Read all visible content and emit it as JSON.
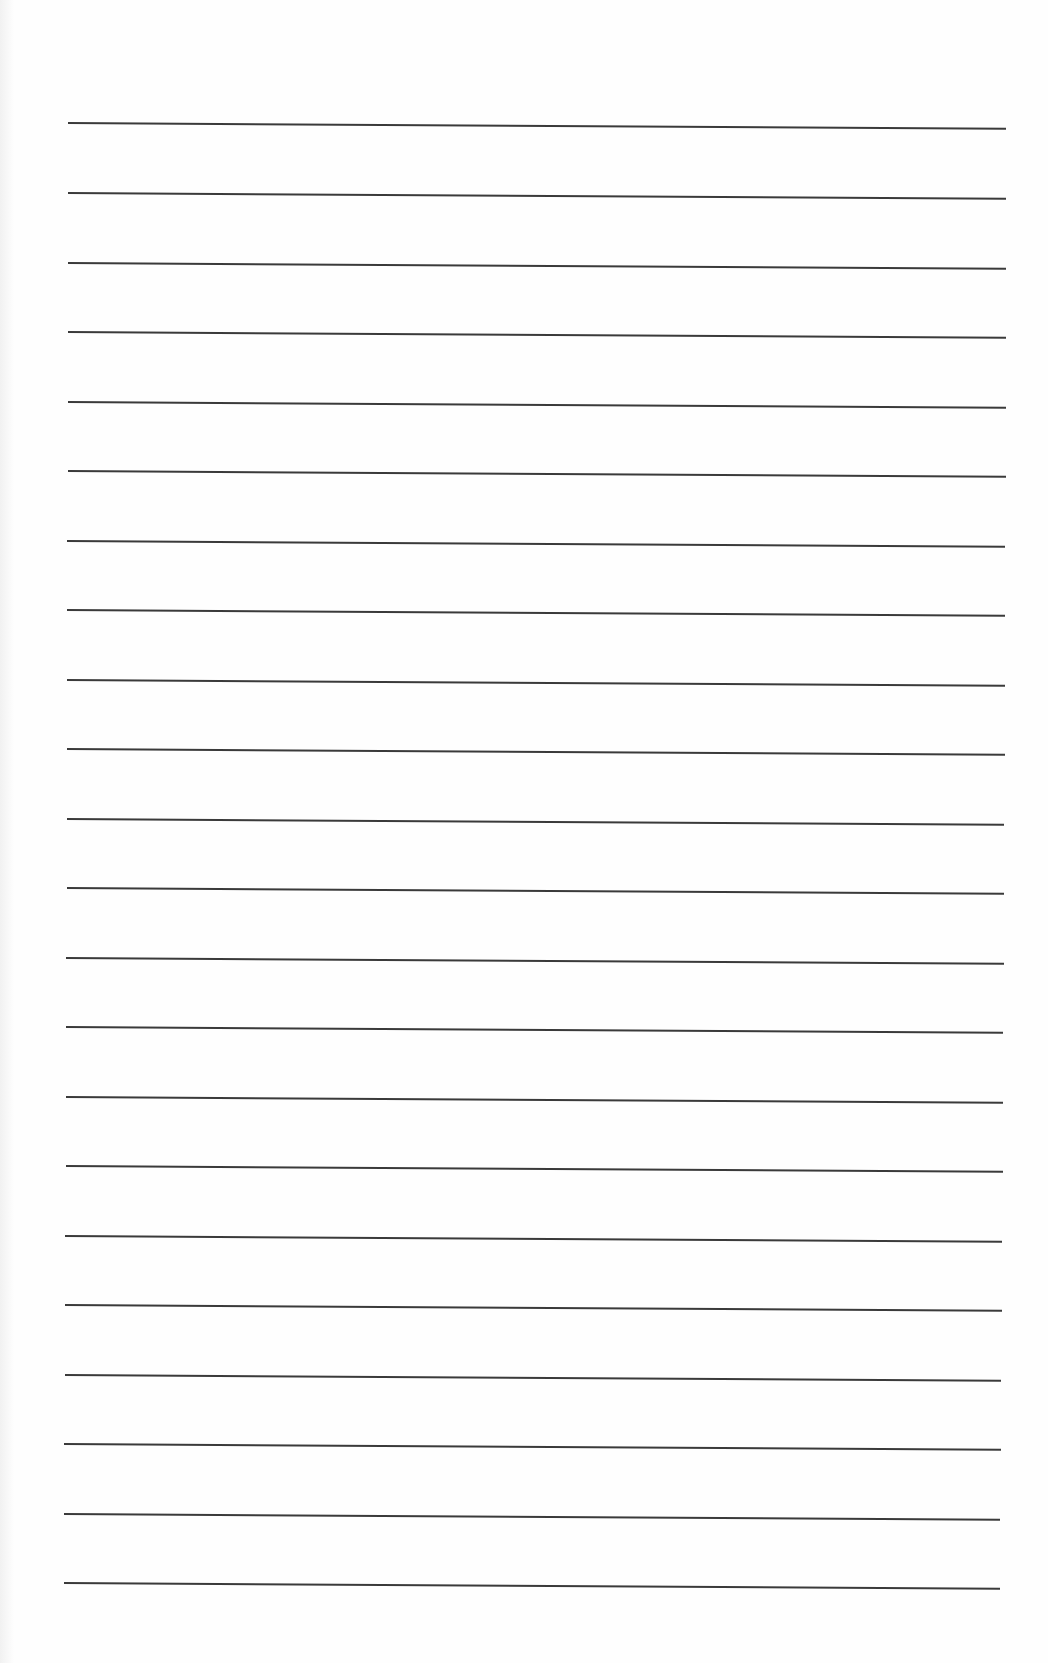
{
  "page": {
    "type": "blank ruled sheet",
    "background_color": "#fefefe",
    "rule_color": "#3a3a3a",
    "rule_count": 22,
    "rules": [
      {
        "y": 122,
        "x1": 68,
        "x2": 1006,
        "tilt": 0.35
      },
      {
        "y": 192,
        "x1": 68,
        "x2": 1006,
        "tilt": 0.35
      },
      {
        "y": 262,
        "x1": 68,
        "x2": 1006,
        "tilt": 0.35
      },
      {
        "y": 331,
        "x1": 68,
        "x2": 1006,
        "tilt": 0.35
      },
      {
        "y": 401,
        "x1": 68,
        "x2": 1006,
        "tilt": 0.35
      },
      {
        "y": 470,
        "x1": 68,
        "x2": 1006,
        "tilt": 0.35
      },
      {
        "y": 540,
        "x1": 67,
        "x2": 1005,
        "tilt": 0.35
      },
      {
        "y": 609,
        "x1": 67,
        "x2": 1005,
        "tilt": 0.35
      },
      {
        "y": 679,
        "x1": 67,
        "x2": 1005,
        "tilt": 0.35
      },
      {
        "y": 748,
        "x1": 67,
        "x2": 1005,
        "tilt": 0.35
      },
      {
        "y": 818,
        "x1": 67,
        "x2": 1004,
        "tilt": 0.35
      },
      {
        "y": 887,
        "x1": 67,
        "x2": 1004,
        "tilt": 0.35
      },
      {
        "y": 957,
        "x1": 66,
        "x2": 1004,
        "tilt": 0.35
      },
      {
        "y": 1026,
        "x1": 66,
        "x2": 1003,
        "tilt": 0.35
      },
      {
        "y": 1096,
        "x1": 66,
        "x2": 1003,
        "tilt": 0.35
      },
      {
        "y": 1165,
        "x1": 66,
        "x2": 1003,
        "tilt": 0.35
      },
      {
        "y": 1235,
        "x1": 65,
        "x2": 1002,
        "tilt": 0.35
      },
      {
        "y": 1304,
        "x1": 65,
        "x2": 1002,
        "tilt": 0.35
      },
      {
        "y": 1374,
        "x1": 65,
        "x2": 1001,
        "tilt": 0.35
      },
      {
        "y": 1443,
        "x1": 64,
        "x2": 1001,
        "tilt": 0.35
      },
      {
        "y": 1513,
        "x1": 64,
        "x2": 1000,
        "tilt": 0.35
      },
      {
        "y": 1582,
        "x1": 64,
        "x2": 1000,
        "tilt": 0.35
      }
    ]
  }
}
